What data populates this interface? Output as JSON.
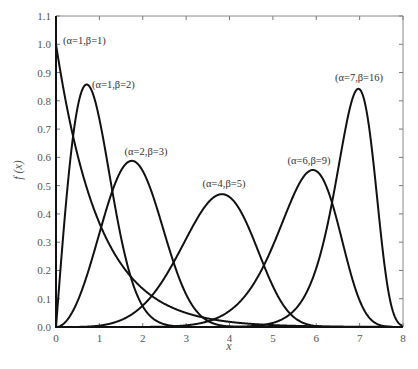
{
  "chart_data": {
    "type": "line",
    "title": "",
    "xlabel": "x",
    "ylabel": "f (x)",
    "xlim": [
      0,
      8
    ],
    "ylim": [
      0,
      1.1
    ],
    "grid": false,
    "legend": "none (inline curve labels)",
    "xticks": [
      "0",
      "1",
      "2",
      "3",
      "4",
      "5",
      "6",
      "7",
      "8"
    ],
    "yticks": [
      "0.0",
      "0.1",
      "0.2",
      "0.3",
      "0.4",
      "0.5",
      "0.6",
      "0.7",
      "0.8",
      "0.9",
      "1.0",
      "1.1"
    ],
    "distribution": "Weibull pdf, scale alpha, shape beta",
    "series": [
      {
        "name": "(α=1,β=1)",
        "alpha": 1,
        "beta": 1,
        "peak_x": 0.0,
        "peak_y": 1.0,
        "label_pos": [
          63,
          44
        ],
        "label_anchor": "start"
      },
      {
        "name": "(α=1,β=2)",
        "alpha": 1,
        "beta": 2,
        "peak_x": 0.71,
        "peak_y": 0.86,
        "label_pos": [
          92,
          88
        ],
        "label_anchor": "start"
      },
      {
        "name": "(α=2,β=3)",
        "alpha": 2,
        "beta": 3,
        "peak_x": 1.75,
        "peak_y": 0.59,
        "label_pos": [
          146,
          155
        ],
        "label_anchor": "middle"
      },
      {
        "name": "(α=4,β=5)",
        "alpha": 4,
        "beta": 5,
        "peak_x": 3.83,
        "peak_y": 0.47,
        "label_pos": [
          224,
          187
        ],
        "label_anchor": "middle"
      },
      {
        "name": "(α=6,β=9)",
        "alpha": 6,
        "beta": 9,
        "peak_x": 5.92,
        "peak_y": 0.55,
        "label_pos": [
          309,
          164
        ],
        "label_anchor": "middle"
      },
      {
        "name": "(α=7,β=16)",
        "alpha": 7,
        "beta": 16,
        "peak_x": 6.97,
        "peak_y": 0.84,
        "label_pos": [
          359,
          81
        ],
        "label_anchor": "middle"
      }
    ]
  },
  "axes": {
    "x_title": "x",
    "y_title": "f (x)"
  }
}
